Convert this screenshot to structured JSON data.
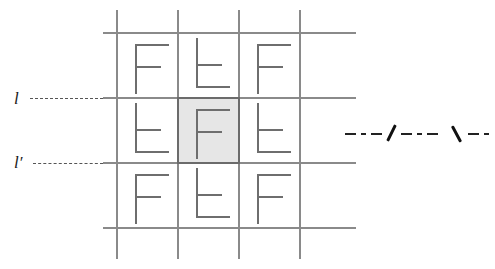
{
  "figure": {
    "background_color": "#ffffff",
    "line_color": "#8a8a8a",
    "glyph_color": "#6e6e6e",
    "shade_color": "#e6e6e6",
    "shade_border_color": "#6b6b6b",
    "ray_color": "#222222"
  },
  "labels": {
    "line_l": "l",
    "line_l_prime": "l′"
  },
  "grid": {
    "rows": 3,
    "cols": 3,
    "cells": [
      [
        {
          "glyph": "F",
          "orientation": "upright",
          "shaded": false
        },
        {
          "glyph": "F",
          "orientation": "lowered",
          "shaded": false
        },
        {
          "glyph": "F",
          "orientation": "upright",
          "shaded": false
        }
      ],
      [
        {
          "glyph": "F",
          "orientation": "lowered",
          "shaded": false
        },
        {
          "glyph": "F",
          "orientation": "upright",
          "shaded": true
        },
        {
          "glyph": "F",
          "orientation": "lowered",
          "shaded": false
        }
      ],
      [
        {
          "glyph": "F",
          "orientation": "upright",
          "shaded": false
        },
        {
          "glyph": "F",
          "orientation": "lowered",
          "shaded": false
        },
        {
          "glyph": "F",
          "orientation": "upright",
          "shaded": false
        }
      ]
    ]
  },
  "annotations": {
    "ray_ticks": 2,
    "ray_style": "dash-dot"
  }
}
